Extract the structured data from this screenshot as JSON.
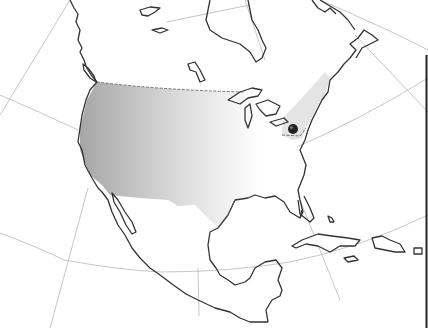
{
  "map": {
    "title": "",
    "region": "North America",
    "colors": {
      "background": "#ffffff",
      "coastline": "#333333",
      "graticule": "#b8b8b8",
      "west_us_shade_start": "#a8a8a8",
      "west_us_shade_end": "#ffffff",
      "northeast_shade": "#e4e4e4",
      "marker": "#222222"
    },
    "shaded_regions": [
      {
        "name": "Western/central United States",
        "style": "gradient gray to white"
      },
      {
        "name": "Northeastern United States",
        "style": "light gray"
      }
    ],
    "marker": {
      "label": "",
      "location": "Mid-Atlantic United States (near Washington D.C.)",
      "x": 293,
      "y": 129
    }
  }
}
